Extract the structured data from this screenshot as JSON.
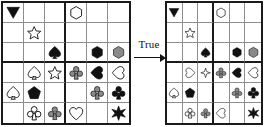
{
  "figure": {
    "type": "two-grid-transformation-puzzle",
    "relation_label": "True",
    "arrow_direction": "right",
    "grid_size": {
      "rows": 6,
      "cols": 6
    },
    "block_size": {
      "rows": 3,
      "cols": 3
    },
    "palette": {
      "black": "#111111",
      "gray": "#8a8a8a",
      "white": "#ffffff",
      "grid_line_thin": "#8d8d8d",
      "grid_line_thick": "#1a1a1a",
      "background": "#ffffff"
    }
  },
  "grids": [
    {
      "name": "left-grid",
      "cells": [
        {
          "r": 0,
          "c": 0,
          "shape": "triangle-down",
          "fill": "black"
        },
        {
          "r": 1,
          "c": 1,
          "shape": "star5",
          "fill": "white"
        },
        {
          "r": 2,
          "c": 2,
          "shape": "spade",
          "fill": "black"
        },
        {
          "r": 3,
          "c": 1,
          "shape": "spade",
          "fill": "white"
        },
        {
          "r": 3,
          "c": 2,
          "shape": "star5",
          "fill": "white"
        },
        {
          "r": 0,
          "c": 3,
          "shape": "hexagon",
          "fill": "white"
        },
        {
          "r": 2,
          "c": 4,
          "shape": "hexagon",
          "fill": "black"
        },
        {
          "r": 2,
          "c": 5,
          "shape": "hexagon",
          "fill": "gray"
        },
        {
          "r": 3,
          "c": 3,
          "shape": "club",
          "fill": "gray"
        },
        {
          "r": 3,
          "c": 4,
          "shape": "heart-left",
          "fill": "black"
        },
        {
          "r": 3,
          "c": 5,
          "shape": "heart-left",
          "fill": "white"
        },
        {
          "r": 4,
          "c": 0,
          "shape": "spade",
          "fill": "white"
        },
        {
          "r": 4,
          "c": 1,
          "shape": "pentagon",
          "fill": "black"
        },
        {
          "r": 5,
          "c": 1,
          "shape": "club",
          "fill": "white"
        },
        {
          "r": 4,
          "c": 4,
          "shape": "club",
          "fill": "gray"
        },
        {
          "r": 4,
          "c": 5,
          "shape": "club",
          "fill": "black"
        },
        {
          "r": 5,
          "c": 3,
          "shape": "heart",
          "fill": "white"
        },
        {
          "r": 5,
          "c": 5,
          "shape": "star6",
          "fill": "black"
        }
      ]
    },
    {
      "name": "right-grid",
      "cells": [
        {
          "r": 0,
          "c": 0,
          "shape": "triangle-down",
          "fill": "black"
        },
        {
          "r": 1,
          "c": 1,
          "shape": "star5",
          "fill": "white"
        },
        {
          "r": 2,
          "c": 2,
          "shape": "spade",
          "fill": "black"
        },
        {
          "r": 3,
          "c": 1,
          "shape": "heart-right",
          "fill": "white"
        },
        {
          "r": 3,
          "c": 2,
          "shape": "star4",
          "fill": "white"
        },
        {
          "r": 0,
          "c": 3,
          "shape": "hexagon",
          "fill": "white"
        },
        {
          "r": 2,
          "c": 4,
          "shape": "hexagon",
          "fill": "black"
        },
        {
          "r": 2,
          "c": 5,
          "shape": "hexagon",
          "fill": "gray"
        },
        {
          "r": 3,
          "c": 3,
          "shape": "club",
          "fill": "gray"
        },
        {
          "r": 3,
          "c": 4,
          "shape": "heart-left",
          "fill": "black"
        },
        {
          "r": 3,
          "c": 5,
          "shape": "heart-left",
          "fill": "white"
        },
        {
          "r": 4,
          "c": 0,
          "shape": "spade",
          "fill": "white"
        },
        {
          "r": 4,
          "c": 1,
          "shape": "pentagon",
          "fill": "black"
        },
        {
          "r": 5,
          "c": 1,
          "shape": "club",
          "fill": "white"
        },
        {
          "r": 4,
          "c": 4,
          "shape": "club",
          "fill": "gray"
        },
        {
          "r": 4,
          "c": 5,
          "shape": "club",
          "fill": "black"
        },
        {
          "r": 5,
          "c": 3,
          "shape": "heart-left",
          "fill": "white"
        },
        {
          "r": 5,
          "c": 5,
          "shape": "star6",
          "fill": "black"
        }
      ]
    }
  ],
  "extra_rows": [
    {
      "grid": "left-grid",
      "r": 6,
      "c": 2,
      "shape": "club",
      "fill": "gray"
    },
    {
      "grid": "left-grid",
      "r": 6,
      "c": 5,
      "shape": "hexagon",
      "fill": "black"
    },
    {
      "grid": "right-grid",
      "r": 6,
      "c": 2,
      "shape": "club",
      "fill": "gray"
    },
    {
      "grid": "right-grid",
      "r": 6,
      "c": 5,
      "shape": "hexagon",
      "fill": "black"
    }
  ]
}
